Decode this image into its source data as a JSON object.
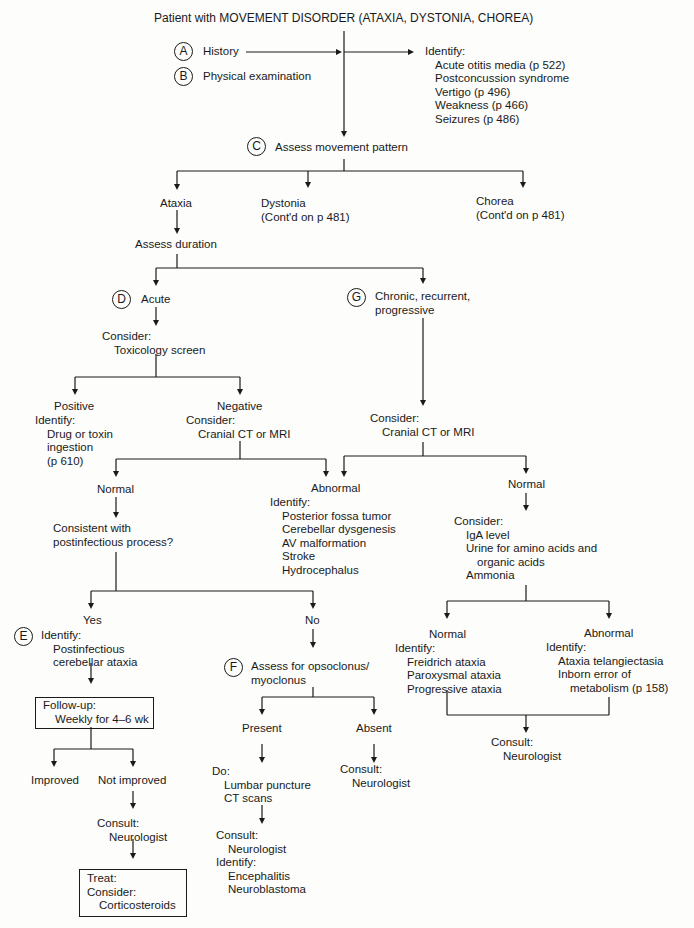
{
  "title": "Patient with MOVEMENT DISORDER (ATAXIA, DYSTONIA, CHOREA)",
  "steps": {
    "A": {
      "letter": "A",
      "label": "History"
    },
    "B": {
      "letter": "B",
      "label": "Physical examination"
    },
    "C": {
      "letter": "C",
      "label": "Assess movement pattern"
    },
    "D": {
      "letter": "D",
      "label": "Acute"
    },
    "E": {
      "letter": "E"
    },
    "F": {
      "letter": "F",
      "label_lines": [
        "Assess for opsoclonus/",
        "myoclonus"
      ]
    },
    "G": {
      "letter": "G",
      "label_lines": [
        "Chronic, recurrent,",
        "progressive"
      ]
    }
  },
  "identify_top": {
    "heading": "Identify:",
    "items": [
      "Acute otitis media (p 522)",
      "Postconcussion syndrome",
      "Vertigo (p 496)",
      "Weakness (p 466)",
      "Seizures (p 486)"
    ]
  },
  "patterns": {
    "ataxia": "Ataxia",
    "dystonia": [
      "Dystonia",
      "(Cont'd on p 481)"
    ],
    "chorea": [
      "Chorea",
      "(Cont'd on p 481)"
    ]
  },
  "assess_duration": "Assess duration",
  "acute_branch": {
    "consider": "Consider:",
    "tox_screen": "Toxicology screen",
    "positive": {
      "label": "Positive",
      "identify": "Identify:",
      "items": [
        "Drug or toxin",
        "ingestion",
        "(p 610)"
      ]
    },
    "negative": {
      "label": "Negative",
      "consider": "Consider:",
      "item": "Cranial CT or MRI"
    },
    "normal": "Normal",
    "question": [
      "Consistent with",
      "postinfectious process?"
    ],
    "yes": {
      "label": "Yes",
      "identify": "Identify:",
      "items": [
        "Postinfectious",
        "cerebellar ataxia"
      ]
    },
    "followup": {
      "heading": "Follow-up:",
      "item": "Weekly for 4–6 wk"
    },
    "improved": "Improved",
    "not_improved": "Not improved",
    "consult1": {
      "heading": "Consult:",
      "item": "Neurologist"
    },
    "treat": {
      "heading": "Treat:",
      "consider": "Consider:",
      "item": "Corticosteroids"
    },
    "no": "No",
    "present": "Present",
    "absent": "Absent",
    "do": {
      "heading": "Do:",
      "items": [
        "Lumbar puncture",
        "CT scans"
      ]
    },
    "consult_present": {
      "heading": "Consult:",
      "item": "Neurologist",
      "identify": "Identify:",
      "items": [
        "Encephalitis",
        "Neuroblastoma"
      ]
    },
    "consult_absent": {
      "heading": "Consult:",
      "item": "Neurologist"
    }
  },
  "abnormal_ct": {
    "label": "Abnormal",
    "identify": "Identify:",
    "items": [
      "Posterior fossa tumor",
      "Cerebellar dysgenesis",
      "AV malformation",
      "Stroke",
      "Hydrocephalus"
    ]
  },
  "chronic_branch": {
    "consider": "Consider:",
    "item": "Cranial CT or MRI",
    "normal": "Normal",
    "consider2": "Consider:",
    "tests": [
      "IgA level",
      "Urine for amino acids and",
      "organic acids",
      "Ammonia"
    ],
    "normal2": {
      "label": "Normal",
      "identify": "Identify:",
      "items": [
        "Freidrich ataxia",
        "Paroxysmal ataxia",
        "Progressive ataxia"
      ]
    },
    "abnormal2": {
      "label": "Abnormal",
      "identify": "Identify:",
      "items": [
        "Ataxia telangiectasia",
        "Inborn error of",
        "metabolism (p 158)"
      ]
    },
    "consult": {
      "heading": "Consult:",
      "item": "Neurologist"
    }
  }
}
